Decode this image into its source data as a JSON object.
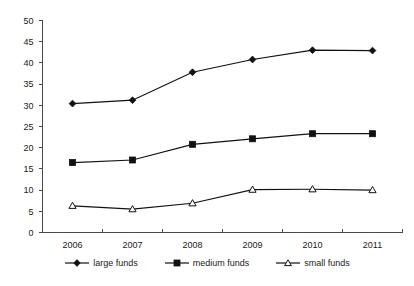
{
  "chart_data": {
    "type": "line",
    "title": "",
    "subtitle": "",
    "xlabel": "",
    "ylabel": "",
    "categories": [
      "2006",
      "2007",
      "2008",
      "2009",
      "2010",
      "2011"
    ],
    "x": [
      2006,
      2007,
      2008,
      2009,
      2010,
      2011
    ],
    "ylim": [
      0,
      50
    ],
    "yticks": [
      0,
      5,
      10,
      15,
      20,
      25,
      30,
      35,
      40,
      45,
      50
    ],
    "ytick_labels": [
      "0",
      "5",
      "10",
      "15",
      "20",
      "25",
      "30",
      "35",
      "40",
      "45",
      "50"
    ],
    "grid": false,
    "legend_position": "bottom",
    "series": [
      {
        "name": "large funds",
        "marker": "filled-diamond",
        "color": "#111111",
        "values": [
          30.4,
          31.2,
          37.8,
          40.8,
          43.0,
          42.9
        ]
      },
      {
        "name": "medium funds",
        "marker": "filled-square",
        "color": "#111111",
        "values": [
          16.5,
          17.1,
          20.8,
          22.1,
          23.3,
          23.3
        ]
      },
      {
        "name": "small funds",
        "marker": "open-triangle",
        "color": "#111111",
        "values": [
          6.3,
          5.5,
          6.9,
          10.1,
          10.2,
          10.0
        ]
      }
    ]
  },
  "legend": {
    "items": [
      {
        "label": "large funds",
        "marker": "diamond-marker-icon"
      },
      {
        "label": "medium funds",
        "marker": "square-marker-icon"
      },
      {
        "label": "small funds",
        "marker": "triangle-marker-icon"
      }
    ]
  }
}
